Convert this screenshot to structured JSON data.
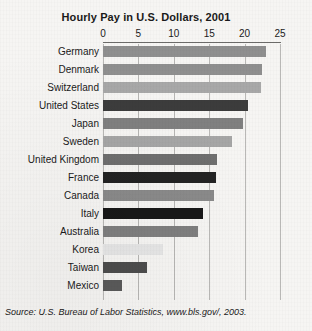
{
  "chart_data": {
    "type": "bar",
    "orientation": "horizontal",
    "title": "Hourly Pay in U.S. Dollars, 2001",
    "xlabel": "",
    "ylabel": "",
    "xlim": [
      0,
      25
    ],
    "ticks": [
      0,
      5,
      10,
      15,
      20,
      25
    ],
    "tick_labels": [
      "0",
      "5",
      "10",
      "15",
      "20",
      "25"
    ],
    "grid": "vertical",
    "legend": "none",
    "categories": [
      "Germany",
      "Denmark",
      "Switzerland",
      "United States",
      "Japan",
      "Sweden",
      "United Kingdom",
      "France",
      "Canada",
      "Italy",
      "Australia",
      "Korea",
      "Taiwan",
      "Mexico"
    ],
    "values": [
      23.0,
      22.5,
      22.3,
      20.5,
      19.8,
      18.2,
      16.1,
      15.9,
      15.7,
      14.1,
      13.4,
      8.5,
      6.2,
      2.7
    ],
    "bar_colors": [
      "#8f8f8f",
      "#8f8f8f",
      "#a8a8a8",
      "#3c3c3c",
      "#808080",
      "#a6a6a6",
      "#6f6f6f",
      "#232323",
      "#8a8a8a",
      "#181818",
      "#7f7f7f",
      "#e6e6e6",
      "#4d4d4d",
      "#5a5a5a"
    ],
    "source": "Source: U.S. Bureau of Labor Statistics, www.bls.gov/, 2003."
  },
  "colors": {
    "background": "#f6f5f3",
    "gridline": "#b9b8b6",
    "axis": "#6d6c6a",
    "text": "#1a1a1a"
  }
}
